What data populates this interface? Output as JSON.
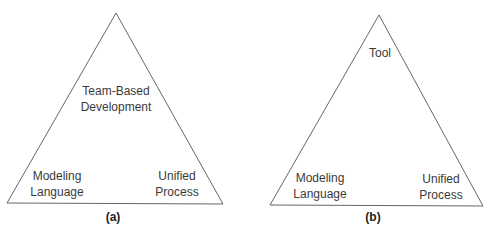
{
  "diagrams": [
    {
      "caption": "(a)",
      "apex": {
        "line1": "Team-Based",
        "line2": "Development"
      },
      "left": {
        "line1": "Modeling",
        "line2": "Language"
      },
      "right": {
        "line1": "Unified",
        "line2": "Process"
      }
    },
    {
      "caption": "(b)",
      "apex": {
        "line1": "Tool"
      },
      "left": {
        "line1": "Modeling",
        "line2": "Language"
      },
      "right": {
        "line1": "Unified",
        "line2": "Process"
      }
    }
  ],
  "colors": {
    "line": "#555555",
    "text": "#3a3a3a"
  }
}
